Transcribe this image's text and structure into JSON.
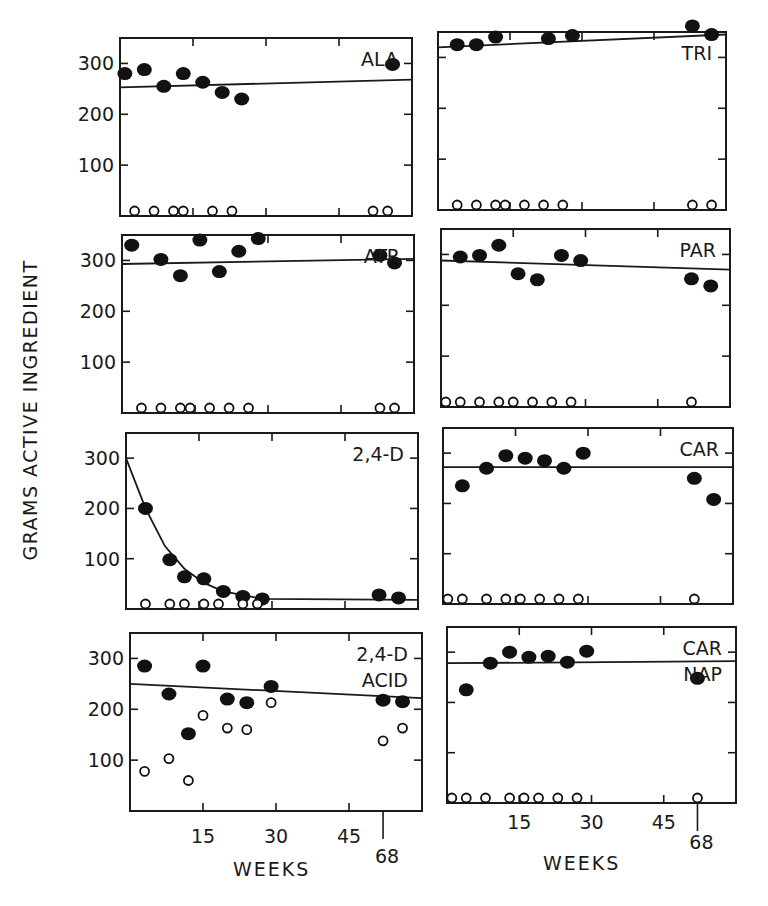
{
  "figure": {
    "ylabel": "GRAMS ACTIVE INGREDIENT",
    "xlabel_left": "WEEKS",
    "xlabel_right": "WEEKS",
    "x_ticks": [
      "15",
      "30",
      "45",
      "68"
    ],
    "y_ticks": [
      "100",
      "200",
      "300"
    ]
  },
  "chart_data": [
    {
      "type": "scatter",
      "title": "ALA",
      "panel": "row1-left",
      "xlabel": "WEEKS",
      "ylabel": "GRAMS ACTIVE INGREDIENT",
      "xlim": [
        0,
        60
      ],
      "ylim": [
        0,
        350
      ],
      "x_ticks": [
        15,
        30,
        45
      ],
      "y_ticks": [
        100,
        200,
        300
      ],
      "series": [
        {
          "name": "filled",
          "points": [
            [
              1,
              280
            ],
            [
              5,
              288
            ],
            [
              9,
              255
            ],
            [
              13,
              280
            ],
            [
              17,
              263
            ],
            [
              21,
              243
            ],
            [
              25,
              230
            ],
            [
              56,
              298
            ]
          ]
        },
        {
          "name": "open",
          "points": [
            [
              3,
              2
            ],
            [
              7,
              2
            ],
            [
              11,
              2
            ],
            [
              13,
              2
            ],
            [
              19,
              2
            ],
            [
              23,
              2
            ],
            [
              52,
              4
            ],
            [
              55,
              4
            ]
          ]
        },
        {
          "name": "fit-line",
          "points": [
            [
              0,
              253
            ],
            [
              60,
              268
            ]
          ]
        }
      ]
    },
    {
      "type": "scatter",
      "title": "TRI",
      "panel": "row1-right",
      "xlim": [
        0,
        60
      ],
      "ylim": [
        0,
        350
      ],
      "series": [
        {
          "name": "filled",
          "points": [
            [
              4,
              325
            ],
            [
              8,
              325
            ],
            [
              12,
              340
            ],
            [
              23,
              337
            ],
            [
              28,
              343
            ],
            [
              53,
              362
            ],
            [
              57,
              345
            ]
          ]
        },
        {
          "name": "open",
          "points": [
            [
              4,
              2
            ],
            [
              8,
              2
            ],
            [
              12,
              2
            ],
            [
              14,
              2
            ],
            [
              18,
              2
            ],
            [
              22,
              2
            ],
            [
              26,
              2
            ],
            [
              53,
              4
            ],
            [
              57,
              4
            ]
          ]
        },
        {
          "name": "fit-line",
          "points": [
            [
              0,
              320
            ],
            [
              60,
              345
            ]
          ]
        }
      ]
    },
    {
      "type": "scatter",
      "title": "ATR",
      "panel": "row2-left",
      "xlim": [
        0,
        60
      ],
      "ylim": [
        0,
        350
      ],
      "series": [
        {
          "name": "filled",
          "points": [
            [
              2,
              330
            ],
            [
              8,
              302
            ],
            [
              12,
              270
            ],
            [
              16,
              340
            ],
            [
              20,
              278
            ],
            [
              24,
              318
            ],
            [
              28,
              343
            ],
            [
              53,
              310
            ],
            [
              56,
              295
            ]
          ]
        },
        {
          "name": "open",
          "points": [
            [
              4,
              2
            ],
            [
              8,
              2
            ],
            [
              12,
              2
            ],
            [
              14,
              2
            ],
            [
              18,
              2
            ],
            [
              22,
              2
            ],
            [
              26,
              2
            ],
            [
              53,
              2
            ],
            [
              56,
              2
            ]
          ]
        },
        {
          "name": "fit-line",
          "points": [
            [
              0,
              293
            ],
            [
              60,
              303
            ]
          ]
        }
      ]
    },
    {
      "type": "scatter",
      "title": "PAR",
      "panel": "row2-right",
      "xlim": [
        0,
        60
      ],
      "ylim": [
        0,
        350
      ],
      "series": [
        {
          "name": "filled",
          "points": [
            [
              4,
              295
            ],
            [
              8,
              298
            ],
            [
              12,
              318
            ],
            [
              16,
              262
            ],
            [
              20,
              250
            ],
            [
              25,
              298
            ],
            [
              29,
              288
            ],
            [
              52,
              252
            ],
            [
              56,
              238
            ]
          ]
        },
        {
          "name": "open",
          "points": [
            [
              1,
              2
            ],
            [
              4,
              2
            ],
            [
              8,
              2
            ],
            [
              12,
              2
            ],
            [
              15,
              2
            ],
            [
              19,
              2
            ],
            [
              23,
              2
            ],
            [
              27,
              2
            ],
            [
              52,
              4
            ]
          ]
        },
        {
          "name": "fit-line",
          "points": [
            [
              0,
              288
            ],
            [
              60,
              270
            ]
          ]
        }
      ]
    },
    {
      "type": "scatter",
      "title": "2,4-D",
      "panel": "row3-left",
      "xlim": [
        0,
        60
      ],
      "ylim": [
        0,
        350
      ],
      "series": [
        {
          "name": "filled",
          "points": [
            [
              4,
              200
            ],
            [
              9,
              98
            ],
            [
              12,
              64
            ],
            [
              16,
              60
            ],
            [
              20,
              35
            ],
            [
              24,
              25
            ],
            [
              28,
              20
            ],
            [
              52,
              28
            ],
            [
              56,
              22
            ]
          ]
        },
        {
          "name": "open",
          "points": [
            [
              4,
              2
            ],
            [
              9,
              2
            ],
            [
              12,
              2
            ],
            [
              16,
              2
            ],
            [
              19,
              2
            ],
            [
              24,
              2
            ],
            [
              27,
              2
            ]
          ]
        },
        {
          "name": "fit-curve",
          "points": [
            [
              0,
              300
            ],
            [
              4,
              200
            ],
            [
              8,
              125
            ],
            [
              12,
              80
            ],
            [
              16,
              52
            ],
            [
              20,
              35
            ],
            [
              28,
              20
            ],
            [
              60,
              18
            ]
          ]
        }
      ]
    },
    {
      "type": "scatter",
      "title": "CAR",
      "panel": "row3-right",
      "xlim": [
        0,
        60
      ],
      "ylim": [
        0,
        350
      ],
      "series": [
        {
          "name": "filled",
          "points": [
            [
              4,
              235
            ],
            [
              9,
              270
            ],
            [
              13,
              295
            ],
            [
              17,
              290
            ],
            [
              21,
              285
            ],
            [
              25,
              270
            ],
            [
              29,
              300
            ],
            [
              52,
              250
            ],
            [
              56,
              208
            ]
          ]
        },
        {
          "name": "open",
          "points": [
            [
              1,
              2
            ],
            [
              4,
              2
            ],
            [
              9,
              2
            ],
            [
              13,
              2
            ],
            [
              16,
              2
            ],
            [
              20,
              2
            ],
            [
              24,
              2
            ],
            [
              28,
              2
            ],
            [
              52,
              4
            ]
          ]
        },
        {
          "name": "fit-line",
          "points": [
            [
              0,
              272
            ],
            [
              60,
              272
            ]
          ]
        }
      ]
    },
    {
      "type": "scatter",
      "title": "2,4-D ACID",
      "panel": "row4-left",
      "xlim": [
        0,
        60
      ],
      "ylim": [
        0,
        350
      ],
      "series": [
        {
          "name": "filled",
          "points": [
            [
              3,
              285
            ],
            [
              8,
              230
            ],
            [
              12,
              152
            ],
            [
              15,
              285
            ],
            [
              20,
              220
            ],
            [
              24,
              213
            ],
            [
              29,
              245
            ],
            [
              52,
              218
            ],
            [
              56,
              215
            ]
          ]
        },
        {
          "name": "open",
          "points": [
            [
              3,
              78
            ],
            [
              8,
              103
            ],
            [
              12,
              60
            ],
            [
              15,
              188
            ],
            [
              20,
              163
            ],
            [
              24,
              160
            ],
            [
              29,
              213
            ],
            [
              52,
              138
            ],
            [
              56,
              163
            ]
          ]
        },
        {
          "name": "fit-line",
          "points": [
            [
              0,
              250
            ],
            [
              60,
              222
            ]
          ]
        }
      ]
    },
    {
      "type": "scatter",
      "title": "CAR NAP",
      "panel": "row4-right",
      "xlim": [
        0,
        60
      ],
      "ylim": [
        0,
        350
      ],
      "series": [
        {
          "name": "filled",
          "points": [
            [
              4,
              225
            ],
            [
              9,
              278
            ],
            [
              13,
              300
            ],
            [
              17,
              290
            ],
            [
              21,
              292
            ],
            [
              25,
              280
            ],
            [
              29,
              302
            ],
            [
              52,
              248
            ]
          ]
        },
        {
          "name": "open",
          "points": [
            [
              1,
              2
            ],
            [
              4,
              2
            ],
            [
              8,
              2
            ],
            [
              13,
              2
            ],
            [
              16,
              2
            ],
            [
              19,
              2
            ],
            [
              23,
              2
            ],
            [
              27,
              2
            ],
            [
              52,
              4
            ]
          ]
        },
        {
          "name": "fit-line",
          "points": [
            [
              0,
              278
            ],
            [
              60,
              282
            ]
          ]
        }
      ]
    }
  ]
}
